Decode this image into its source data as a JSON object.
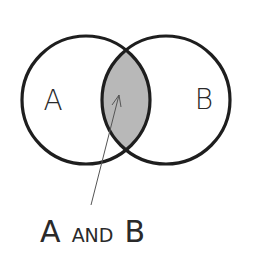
{
  "diagram": {
    "type": "venn",
    "sets": [
      {
        "id": "A",
        "label": "A"
      },
      {
        "id": "B",
        "label": "B"
      }
    ],
    "intersection": {
      "label_parts": [
        "A",
        "AND",
        "B"
      ],
      "label": "A AND B",
      "fill_color": "#b8b8b8"
    },
    "colors": {
      "outline": "#1e1e1e",
      "text": "#2a2a2a",
      "arrow": "#555555",
      "background": "#ffffff"
    }
  }
}
